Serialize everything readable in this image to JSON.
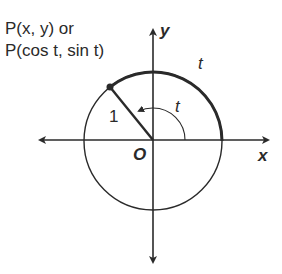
{
  "diagram": {
    "type": "unit-circle",
    "point_label_line1": "P(x, y) or",
    "point_label_line2": "P(cos t, sin t)",
    "radius_label": "1",
    "angle_label": "t",
    "arc_label": "t",
    "x_axis_label": "x",
    "y_axis_label": "y",
    "origin_label": "O",
    "colors": {
      "stroke": "#2a2a2a",
      "background": "#ffffff"
    },
    "geometry": {
      "center": [
        153,
        141
      ],
      "radius": 69,
      "point": [
        110,
        87
      ],
      "x_axis": [
        40,
        268
      ],
      "y_axis": [
        30,
        262
      ]
    }
  }
}
